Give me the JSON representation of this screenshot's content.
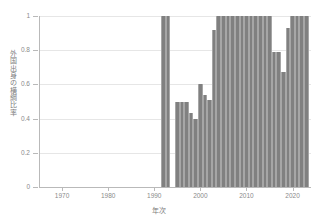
{
  "chart_data": {
    "type": "bar",
    "title": "",
    "subtitle": "",
    "xlabel": "年次",
    "ylabel": "外国出身の横綱比率",
    "xlim": [
      1965,
      2024
    ],
    "ylim": [
      0,
      1.0
    ],
    "grid": true,
    "legend": null,
    "bar_color": "#808080",
    "bar_edge_color": "#a6a6a6",
    "xticks": [
      1970,
      1980,
      1990,
      2000,
      2010,
      2020
    ],
    "xtick_labels": [
      "1970",
      "1980",
      "1990",
      "2000",
      "2010",
      "2020"
    ],
    "yticks": [
      0,
      0.2,
      0.4,
      0.6,
      0.8,
      1
    ],
    "ytick_labels": [
      "0",
      "0.2",
      "0.4",
      "0.6",
      "0.8",
      "1"
    ],
    "x": [
      1992,
      1993,
      1994,
      1995,
      1996,
      1997,
      1998,
      1999,
      2000,
      2001,
      2002,
      2003,
      2004,
      2005,
      2006,
      2007,
      2008,
      2009,
      2010,
      2011,
      2012,
      2013,
      2014,
      2015,
      2016,
      2017,
      2018,
      2019,
      2020,
      2021,
      2022,
      2023
    ],
    "values": [
      1,
      1,
      0,
      0.5,
      0.5,
      0.5,
      0.43,
      0.4,
      0.6,
      0.54,
      0.51,
      0.92,
      1,
      1,
      1,
      1,
      1,
      1,
      1,
      1,
      1,
      1,
      1,
      1,
      0.79,
      0.79,
      0.67,
      0.93,
      1,
      1,
      1,
      1
    ],
    "categories": [
      "1992",
      "1993",
      "1994",
      "1995",
      "1996",
      "1997",
      "1998",
      "1999",
      "2000",
      "2001",
      "2002",
      "2003",
      "2004",
      "2005",
      "2006",
      "2007",
      "2008",
      "2009",
      "2010",
      "2011",
      "2012",
      "2013",
      "2014",
      "2015",
      "2016",
      "2017",
      "2018",
      "2019",
      "2020",
      "2021",
      "2022",
      "2023"
    ],
    "bar_width_years": 1
  },
  "figure": {
    "background": "#ffffff",
    "axis_color": "#b9b9b9",
    "grid_color": "#e6e6e6",
    "tick_text_color": "#8a8a8a",
    "label_text_color": "#7d7d7d"
  }
}
